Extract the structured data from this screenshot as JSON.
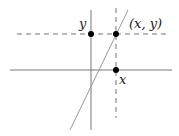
{
  "diagram": {
    "title": "",
    "labels": {
      "y_axis_point": "y",
      "point": "(x, y)",
      "x_axis_point": "x"
    },
    "colors": {
      "axis": "#777777",
      "line": "#999999",
      "dashed": "#777777",
      "dot": "#000000",
      "text": "#222222"
    },
    "elements": {
      "horizontal_axis": {
        "x1": 10,
        "y1": 70,
        "x2": 172,
        "y2": 70
      },
      "vertical_axis": {
        "x1": 91,
        "y1": 10,
        "x2": 91,
        "y2": 130
      },
      "slanted_line": {
        "x1": 70,
        "y1": 130,
        "x2": 128,
        "y2": 10
      },
      "dashed_horizontal": {
        "x1": 17,
        "y1": 34,
        "x2": 167,
        "y2": 34
      },
      "dashed_vertical": {
        "x1": 116,
        "y1": 8,
        "x2": 116,
        "y2": 118
      },
      "points": [
        {
          "name": "y-intercept-dot",
          "x": 91,
          "y": 34
        },
        {
          "name": "xy-point-dot",
          "x": 116,
          "y": 34
        },
        {
          "name": "x-axis-dot",
          "x": 116,
          "y": 70
        }
      ]
    }
  }
}
